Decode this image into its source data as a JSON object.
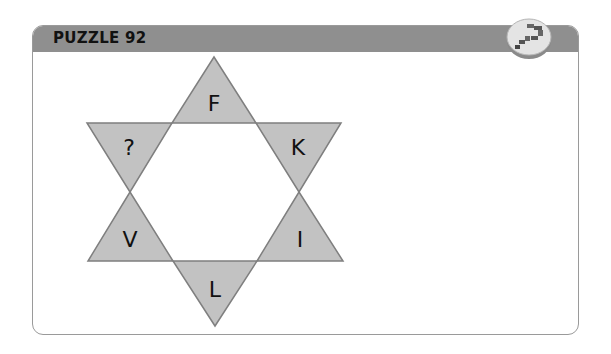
{
  "header": {
    "title": "PUZZLE 92"
  },
  "badge": {
    "icon": "puzzle-blocks-icon"
  },
  "puzzle": {
    "shape": "six-pointed-star",
    "points": {
      "top": "F",
      "upper_left": "?",
      "upper_right": "K",
      "lower_left": "V",
      "lower_right": "I",
      "bottom": "L"
    }
  },
  "colors": {
    "header_bg": "#8f8f8f",
    "triangle_fill": "#c2c2c2",
    "triangle_stroke": "#7f7f7f",
    "card_border": "#9a9a9a"
  }
}
